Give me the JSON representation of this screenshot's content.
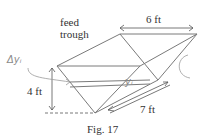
{
  "figure": {
    "caption": "Fig. 17",
    "title_line1": "feed",
    "title_line2": "trough",
    "width_label": "6 ft",
    "height_label": "4 ft",
    "length_label": "7 ft",
    "handwritten_left": "Δyᵢ",
    "handwritten_mid": "yᵢ"
  },
  "colors": {
    "lines": "#7a7a7a",
    "text": "#333333",
    "handwriting": "#8a8a8a"
  }
}
